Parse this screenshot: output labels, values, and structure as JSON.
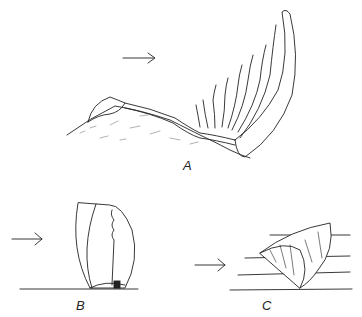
{
  "figure": {
    "panels": [
      {
        "label": "A",
        "subject": "crinoid attached to sediment mound, arms extended in current"
      },
      {
        "label": "B",
        "subject": "upright shell resting on substrate"
      },
      {
        "label": "C",
        "subject": "wedge-shaped shell resting on substrate with flow lines"
      }
    ],
    "arrows": [
      "current-direction",
      "current-direction",
      "current-direction"
    ],
    "colors": {
      "ink": "#222222",
      "background": "#ffffff"
    }
  }
}
